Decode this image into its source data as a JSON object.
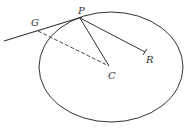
{
  "diagram": {
    "type": "geometry",
    "colors": {
      "stroke": "#333333",
      "background": "#ffffff"
    },
    "ellipse": {
      "cx": 111,
      "cy": 67,
      "rx": 72,
      "ry": 55
    },
    "points": {
      "P": {
        "label": "P",
        "x": 80,
        "y": 18,
        "label_x": 78,
        "label_y": 14
      },
      "G": {
        "label": "G",
        "x": 38,
        "y": 31,
        "label_x": 31,
        "label_y": 26
      },
      "C": {
        "label": "C",
        "x": 109,
        "y": 66,
        "label_x": 108,
        "label_y": 79
      },
      "R": {
        "label": "R",
        "x": 145,
        "y": 52,
        "label_x": 146,
        "label_y": 63
      }
    },
    "lines": [
      {
        "name": "tangent",
        "from": [
          4,
          41
        ],
        "to": [
          82,
          17
        ],
        "style": "solid"
      },
      {
        "name": "G-C",
        "from": [
          38,
          31
        ],
        "to": [
          109,
          66
        ],
        "style": "dashed"
      },
      {
        "name": "P-C",
        "from": [
          80,
          18
        ],
        "to": [
          109,
          66
        ],
        "style": "solid"
      },
      {
        "name": "P-R",
        "from": [
          80,
          18
        ],
        "to": [
          145,
          52
        ],
        "style": "solid"
      }
    ]
  }
}
